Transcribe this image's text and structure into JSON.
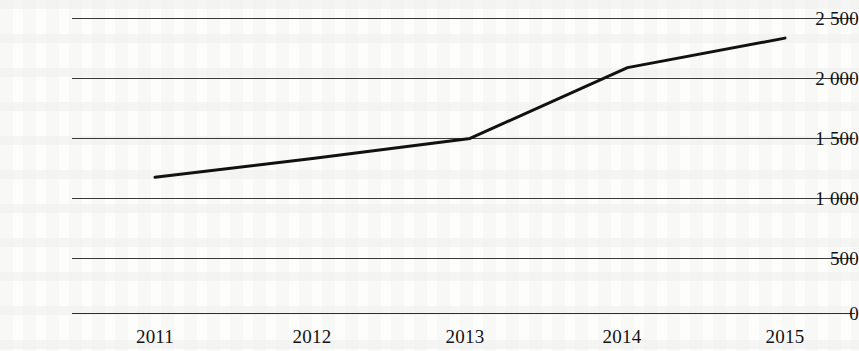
{
  "chart_data": {
    "type": "line",
    "title": "",
    "subtitle": "",
    "xlabel": "",
    "ylabel": "",
    "categories": [
      "2011",
      "2012",
      "2013",
      "2014",
      "2015"
    ],
    "x": [
      2011,
      2012,
      2013,
      2014,
      2015
    ],
    "values": [
      1150,
      1310,
      1480,
      2080,
      2330
    ],
    "series": [
      {
        "name": "",
        "values": [
          1150,
          1310,
          1480,
          2080,
          2330
        ]
      }
    ],
    "ylim": [
      0,
      2500
    ],
    "yticks": [
      0,
      500,
      1000,
      1500,
      2000,
      2500
    ],
    "ytick_labels": [
      "0",
      "500",
      "1 000",
      "1 500",
      "2 000",
      "2 500"
    ],
    "xtick_labels": [
      "2011",
      "2012",
      "2013",
      "2014",
      "2015"
    ],
    "grid": true,
    "grid_axis": "y",
    "legend": false,
    "legend_position": "none",
    "markers": false,
    "line_color": "#111111",
    "line_width": 3,
    "background_color": "#fdfdfc",
    "grid_color": "#3a3a3a",
    "axis_color": "#2f2f2f",
    "text_color": "#111111",
    "annotations": []
  },
  "axes": {
    "y_labels": [
      {
        "text": "2 500",
        "value": 2500
      },
      {
        "text": "2 000",
        "value": 2000
      },
      {
        "text": "1 500",
        "value": 1500
      },
      {
        "text": "1 000",
        "value": 1000
      },
      {
        "text": "500",
        "value": 500
      },
      {
        "text": "0",
        "value": 0
      }
    ],
    "x_labels": [
      {
        "text": "2011"
      },
      {
        "text": "2012"
      },
      {
        "text": "2013"
      },
      {
        "text": "2014"
      },
      {
        "text": "2015"
      }
    ]
  }
}
